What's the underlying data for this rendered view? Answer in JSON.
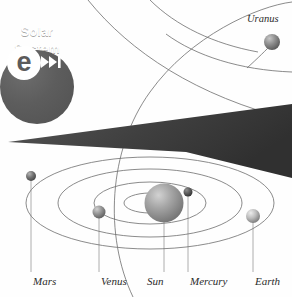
{
  "illustration": {
    "title": "Solar System orbital diagram",
    "background_color": "#fefefe"
  },
  "logo": {
    "name": "e-solar-system-badge",
    "mark_letter": "e",
    "skip_icon": "skip-forward-icon",
    "line1": "Solar",
    "line2": "System",
    "badge_color": "#5d5d5d",
    "mark_color": "#ffffff",
    "text_color": "#ffffff"
  },
  "labels": {
    "mars": "Mars",
    "venus": "Venus",
    "sun": "Sun",
    "mercury": "Mercury",
    "earth": "Earth",
    "uranus": "Uranus"
  },
  "bodies": [
    {
      "name": "sun",
      "label": "Sun",
      "cx": 164,
      "cy": 203,
      "r": 19.5,
      "color": "#9a9a9a"
    },
    {
      "name": "mercury",
      "label": "Mercury",
      "cx": 188,
      "cy": 192,
      "r": 4.5,
      "color": "#585858"
    },
    {
      "name": "venus",
      "label": "Venus",
      "cx": 99,
      "cy": 212,
      "r": 6.5,
      "color": "#8f8f8f"
    },
    {
      "name": "earth",
      "label": "Earth",
      "cx": 253,
      "cy": 216,
      "r": 7.0,
      "color": "#b4b4b4"
    },
    {
      "name": "mars",
      "label": "Mars",
      "cx": 31,
      "cy": 176,
      "r": 5.0,
      "color": "#6f6f6f"
    },
    {
      "name": "uranus",
      "label": "Uranus",
      "cx": 272,
      "cy": 42,
      "r": 8.0,
      "color": "#8a8a8a"
    }
  ],
  "colors": {
    "orbit_line": "#6d6d6d",
    "leader_line": "#9a9a9a",
    "wedge_dark": "#3a3a3a",
    "wedge_mid": "#4a4a4a"
  }
}
